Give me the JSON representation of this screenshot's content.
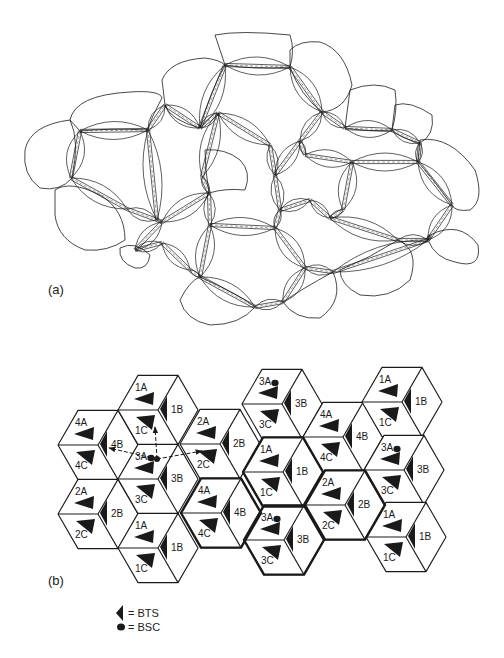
{
  "figure": {
    "panel_a_label": "(a)",
    "panel_b_label": "(b)"
  },
  "panel_a": {
    "description": "Network of molecular nodes with double-line bonds and surrounding cell outlines",
    "nodes": [
      [
        80,
        131
      ],
      [
        148,
        130
      ],
      [
        71,
        178
      ],
      [
        127,
        209
      ],
      [
        157,
        220
      ],
      [
        165,
        105
      ],
      [
        200,
        128
      ],
      [
        225,
        65
      ],
      [
        290,
        67
      ],
      [
        218,
        113
      ],
      [
        270,
        145
      ],
      [
        202,
        177
      ],
      [
        209,
        193
      ],
      [
        162,
        222
      ],
      [
        135,
        250
      ],
      [
        300,
        141
      ],
      [
        322,
        112
      ],
      [
        345,
        128
      ],
      [
        305,
        155
      ],
      [
        352,
        162
      ],
      [
        392,
        130
      ],
      [
        420,
        143
      ],
      [
        418,
        162
      ],
      [
        452,
        205
      ],
      [
        428,
        240
      ],
      [
        398,
        240
      ],
      [
        275,
        175
      ],
      [
        280,
        210
      ],
      [
        310,
        200
      ],
      [
        330,
        218
      ],
      [
        343,
        210
      ],
      [
        210,
        225
      ],
      [
        275,
        228
      ],
      [
        200,
        277
      ],
      [
        255,
        307
      ],
      [
        283,
        302
      ],
      [
        305,
        268
      ],
      [
        333,
        272
      ],
      [
        162,
        243
      ],
      [
        190,
        270
      ],
      [
        125,
        240
      ],
      [
        145,
        262
      ],
      [
        395,
        273
      ],
      [
        430,
        235
      ]
    ],
    "bonds": [
      [
        0,
        1
      ],
      [
        0,
        2
      ],
      [
        2,
        3
      ],
      [
        3,
        4
      ],
      [
        1,
        5
      ],
      [
        1,
        4
      ],
      [
        5,
        6
      ],
      [
        6,
        7
      ],
      [
        7,
        8
      ],
      [
        8,
        16
      ],
      [
        6,
        9
      ],
      [
        9,
        10
      ],
      [
        9,
        11
      ],
      [
        11,
        12
      ],
      [
        12,
        13
      ],
      [
        13,
        4
      ],
      [
        13,
        14
      ],
      [
        10,
        26
      ],
      [
        26,
        27
      ],
      [
        26,
        15
      ],
      [
        15,
        16
      ],
      [
        16,
        17
      ],
      [
        15,
        18
      ],
      [
        18,
        19
      ],
      [
        17,
        20
      ],
      [
        20,
        21
      ],
      [
        21,
        22
      ],
      [
        19,
        22
      ],
      [
        22,
        23
      ],
      [
        23,
        24
      ],
      [
        24,
        25
      ],
      [
        25,
        29
      ],
      [
        29,
        30
      ],
      [
        30,
        19
      ],
      [
        27,
        28
      ],
      [
        28,
        29
      ],
      [
        12,
        31
      ],
      [
        31,
        32
      ],
      [
        32,
        27
      ],
      [
        31,
        33
      ],
      [
        33,
        34
      ],
      [
        34,
        35
      ],
      [
        35,
        36
      ],
      [
        36,
        37
      ],
      [
        37,
        24
      ],
      [
        32,
        36
      ],
      [
        14,
        38
      ],
      [
        38,
        39
      ],
      [
        39,
        33
      ],
      [
        24,
        43
      ]
    ]
  },
  "panel_b": {
    "hex_radius": 40,
    "cells": [
      {
        "id": "hex-4-top-left",
        "cx": 98,
        "cy": 445,
        "n": "4",
        "labels": {
          "a": "4A",
          "b": "4B",
          "c": "4C"
        },
        "bsc": false
      },
      {
        "id": "hex-2-bottom-left",
        "cx": 98,
        "cy": 514,
        "n": "2",
        "labels": {
          "a": "2A",
          "b": "2B",
          "c": "2C"
        },
        "bsc": false
      },
      {
        "id": "hex-1-col1-top",
        "cx": 158,
        "cy": 410,
        "n": "1",
        "labels": {
          "a": "1A",
          "b": "1B",
          "c": "1C"
        },
        "bsc": false
      },
      {
        "id": "hex-3-col1-mid",
        "cx": 158,
        "cy": 479,
        "n": "3",
        "labels": {
          "a": "3A",
          "b": "3B",
          "c": "3C"
        },
        "bsc": true
      },
      {
        "id": "hex-1-col1-bottom",
        "cx": 158,
        "cy": 548,
        "n": "1",
        "labels": {
          "a": "1A",
          "b": "1B",
          "c": "1C"
        },
        "bsc": false
      },
      {
        "id": "hex-2-col2-top",
        "cx": 220,
        "cy": 444,
        "n": "2",
        "labels": {
          "a": "2A",
          "b": "2B",
          "c": "2C"
        },
        "bsc": false
      },
      {
        "id": "hex-4-col2-bottom",
        "cx": 221,
        "cy": 513,
        "n": "4",
        "labels": {
          "a": "4A",
          "b": "4B",
          "c": "4C"
        },
        "bsc": false
      },
      {
        "id": "hex-3-col3-top",
        "cx": 282,
        "cy": 404,
        "n": "3",
        "labels": {
          "a": "3A",
          "b": "3B",
          "c": "3C"
        },
        "bsc": true
      },
      {
        "id": "hex-1-col3-mid",
        "cx": 283,
        "cy": 472,
        "n": "1",
        "labels": {
          "a": "1A",
          "b": "1B",
          "c": "1C"
        },
        "bsc": false
      },
      {
        "id": "hex-3-col3-bottom",
        "cx": 284,
        "cy": 540,
        "n": "3",
        "labels": {
          "a": "3A",
          "b": "3B",
          "c": "3C"
        },
        "bsc": true
      },
      {
        "id": "hex-4-col4-top",
        "cx": 343,
        "cy": 437,
        "n": "4",
        "labels": {
          "a": "4A",
          "b": "4B",
          "c": "4C"
        },
        "bsc": false
      },
      {
        "id": "hex-2-col4-bottom",
        "cx": 345,
        "cy": 505,
        "n": "2",
        "labels": {
          "a": "2A",
          "b": "2B",
          "c": "2C"
        },
        "bsc": false
      },
      {
        "id": "hex-1-col5-top",
        "cx": 402,
        "cy": 402,
        "n": "1",
        "labels": {
          "a": "1A",
          "b": "1B",
          "c": "1C"
        },
        "bsc": false
      },
      {
        "id": "hex-3-col5-mid",
        "cx": 404,
        "cy": 470,
        "n": "3",
        "labels": {
          "a": "3A",
          "b": "3B",
          "c": "3C"
        },
        "bsc": true
      },
      {
        "id": "hex-1-col5-bottom",
        "cx": 406,
        "cy": 537,
        "n": "1",
        "labels": {
          "a": "1A",
          "b": "1B",
          "c": "1C"
        },
        "bsc": false
      }
    ],
    "highlighted_cluster": [
      "hex-1-col3-mid",
      "hex-4-col2-bottom",
      "hex-3-col3-bottom",
      "hex-2-col4-bottom"
    ],
    "hop_arrows": {
      "origin": [
        157,
        459
      ],
      "targets": [
        [
          155,
          427
        ],
        [
          109,
          448
        ],
        [
          202,
          451
        ]
      ]
    }
  },
  "legend": {
    "items": [
      {
        "symbol": "bts-triangle",
        "label": "= BTS"
      },
      {
        "symbol": "bsc-dot",
        "label": "= BSC"
      }
    ]
  },
  "colors": {
    "ink": "#1a1a1a",
    "background": "#ffffff"
  }
}
